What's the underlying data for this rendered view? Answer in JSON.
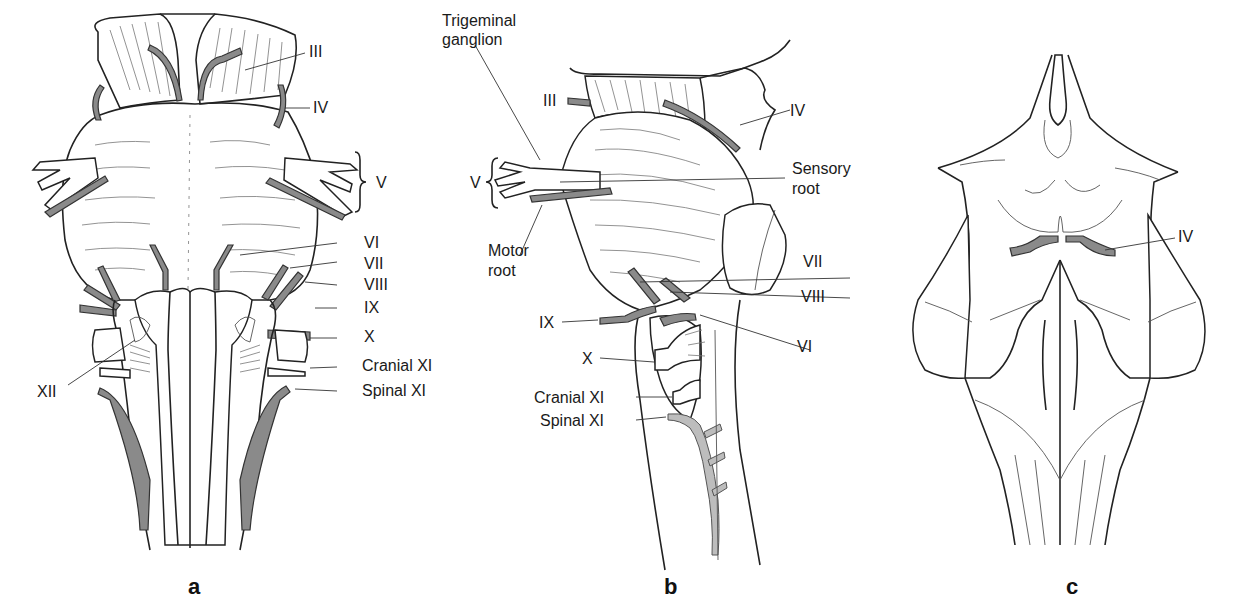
{
  "figure": {
    "panels": [
      {
        "id": "a",
        "letter": "a",
        "view": "ventral view of brainstem",
        "labels": {
          "III": "III",
          "IV": "IV",
          "V": "V",
          "VI": "VI",
          "VII": "VII",
          "VIII": "VIII",
          "IX": "IX",
          "X": "X",
          "cranial_XI": "Cranial XI",
          "spinal_XI": "Spinal XI",
          "XII": "XII"
        }
      },
      {
        "id": "b",
        "letter": "b",
        "view": "lateral view of brainstem",
        "labels": {
          "trigeminal_ganglion_line1": "Trigeminal",
          "trigeminal_ganglion_line2": "ganglion",
          "III": "III",
          "IV": "IV",
          "V": "V",
          "sensory_root_line1": "Sensory",
          "sensory_root_line2": "root",
          "motor_root_line1": "Motor",
          "motor_root_line2": "root",
          "VII": "VII",
          "VIII": "VIII",
          "VI": "VI",
          "IX": "IX",
          "X": "X",
          "cranial_XI": "Cranial XI",
          "spinal_XI": "Spinal XI"
        }
      },
      {
        "id": "c",
        "letter": "c",
        "view": "dorsal view of brainstem",
        "labels": {
          "IV": "IV"
        }
      }
    ],
    "colors": {
      "nerve_fill": "#8a8a8a",
      "light_nerve_fill": "#bdbdbd",
      "outline": "#222222",
      "background": "#ffffff"
    }
  }
}
